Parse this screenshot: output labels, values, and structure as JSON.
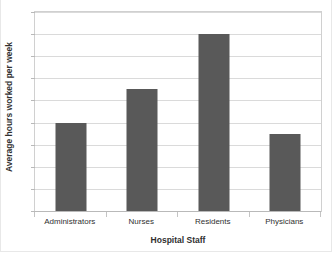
{
  "chart_data": {
    "type": "bar",
    "title": "",
    "xlabel": "Hospital Staff",
    "ylabel": "Average hours worked per week",
    "categories": [
      "Administrators",
      "Nurses",
      "Residents",
      "Physicians"
    ],
    "values": [
      40,
      55,
      80,
      35
    ],
    "ylim": [
      0,
      90
    ],
    "ytick_step": 10,
    "yticks": [
      90,
      80,
      70,
      60,
      50,
      40,
      30,
      20,
      10,
      0
    ],
    "ytick_labels": [
      "90",
      "80",
      "70",
      "60",
      "50",
      "40",
      "30",
      "20",
      "10",
      "0"
    ],
    "grid": "horizontal",
    "legend": "none",
    "bar_color": "#595959",
    "gridline_color": "#dadada",
    "plot_border_color": "#d0d0d0",
    "text_color": "#2f2f2f"
  },
  "axes": {
    "x_title": "Hospital Staff",
    "y_title": "Average hours worked per week"
  }
}
